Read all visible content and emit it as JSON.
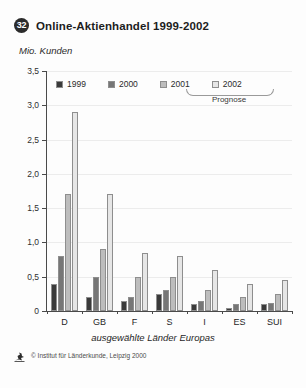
{
  "figure": {
    "badge": "32",
    "title": "Online-Aktienhandel 1999-2002",
    "y_unit": "Mio. Kunden",
    "x_caption": "ausgewählte Länder Europas",
    "prognose_label": "Prognose",
    "footer_text": "© Institut für Länderkunde, Leipzig 2000",
    "footer_logo_icon": "ifl-logo-icon"
  },
  "colors": {
    "series_1999": "#3a3a3a",
    "series_2000": "#767676",
    "series_2001": "#bdbdbd",
    "series_2002": "#e6e6e6",
    "bar_outline": "#8e8e8e",
    "axis": "#4a4a4a",
    "grid": "#ececec",
    "background": "#fdfdfd"
  },
  "chart_data": {
    "type": "bar",
    "title": "Online-Aktienhandel 1999-2002",
    "xlabel": "ausgewählte Länder Europas",
    "ylabel": "Mio. Kunden",
    "ylim": [
      0,
      3.5
    ],
    "grid": true,
    "legend_position": "top-inside",
    "ytick_labels": [
      "0",
      "0,5",
      "1,0",
      "1,5",
      "2,0",
      "2,5",
      "3,0",
      "3,5"
    ],
    "ytick_values": [
      0,
      0.5,
      1.0,
      1.5,
      2.0,
      2.5,
      3.0,
      3.5
    ],
    "categories": [
      "D",
      "GB",
      "F",
      "S",
      "I",
      "ES",
      "SUI"
    ],
    "series": [
      {
        "name": "1999",
        "color": "#3a3a3a",
        "values": [
          0.4,
          0.2,
          0.15,
          0.25,
          0.1,
          0.05,
          0.1
        ]
      },
      {
        "name": "2000",
        "color": "#767676",
        "values": [
          0.8,
          0.5,
          0.2,
          0.3,
          0.15,
          0.1,
          0.12
        ]
      },
      {
        "name": "2001",
        "color": "#bdbdbd",
        "values": [
          1.7,
          0.9,
          0.5,
          0.5,
          0.3,
          0.2,
          0.25
        ]
      },
      {
        "name": "2002",
        "color": "#e6e6e6",
        "values": [
          2.9,
          1.7,
          0.85,
          0.8,
          0.6,
          0.4,
          0.45
        ]
      }
    ],
    "annotations": [
      {
        "text": "Prognose",
        "covers": [
          "2001",
          "2002"
        ]
      }
    ]
  }
}
